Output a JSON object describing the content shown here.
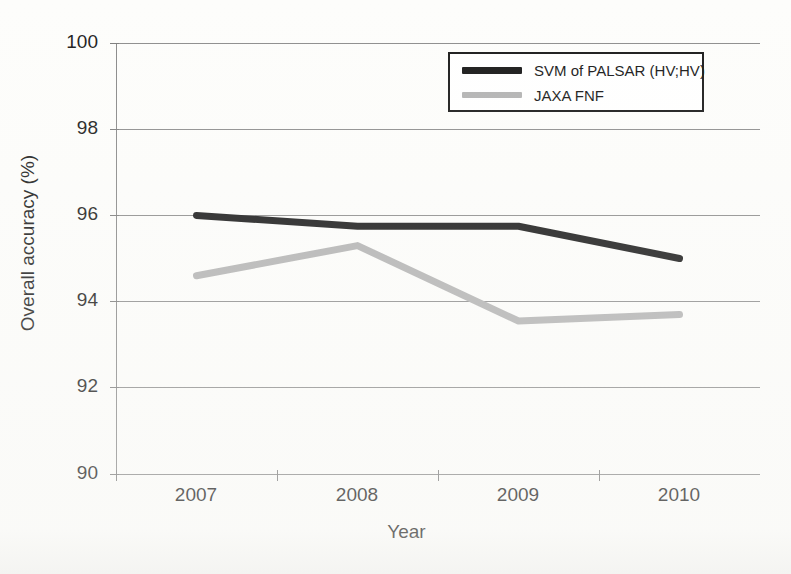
{
  "chart_data": {
    "type": "line",
    "title": "",
    "xlabel": "Year",
    "ylabel": "Overall accuracy (%)",
    "categories": [
      "2007",
      "2008",
      "2009",
      "2010"
    ],
    "ylim": [
      90,
      100
    ],
    "yticks": [
      "90",
      "92",
      "94",
      "96",
      "98",
      "100"
    ],
    "grid": "horizontal",
    "legend_position": "top-right",
    "series": [
      {
        "name": "SVM of PALSAR (HV;HV)",
        "color": "#1a1a1a",
        "values": [
          96.0,
          95.75,
          95.75,
          95.0
        ]
      },
      {
        "name": "JAXA FNF",
        "color": "#b3b3b3",
        "values": [
          94.6,
          95.3,
          93.55,
          93.7
        ]
      }
    ]
  },
  "axes": {
    "y_title": "Overall accuracy (%)",
    "x_title": "Year",
    "y_tick_labels": [
      "100",
      "98",
      "96",
      "94",
      "92",
      "90"
    ],
    "x_tick_labels": [
      "2007",
      "2008",
      "2009",
      "2010"
    ]
  },
  "legend": {
    "items": [
      {
        "label": "SVM of PALSAR (HV;HV)",
        "color": "#1a1a1a",
        "style": "thick-solid"
      },
      {
        "label": "JAXA FNF",
        "color": "#b3b3b3",
        "style": "solid"
      }
    ]
  },
  "colors": {
    "background": "#fdfdfb",
    "axis": "#8a8a8a",
    "grid": "#8e8e8e",
    "text": "#1d1d1d",
    "series_dark": "#1a1a1a",
    "series_gray": "#b3b3b3"
  }
}
